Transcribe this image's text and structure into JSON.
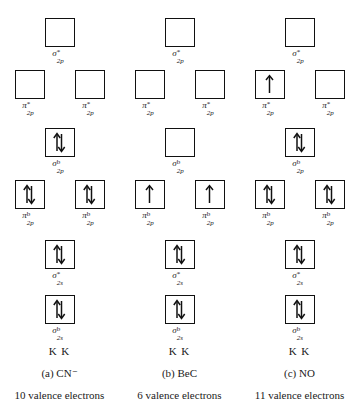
{
  "figure": {
    "type": "molecular-orbital-energy-level-diagram",
    "columns": [
      {
        "caption": "(a)  CN⁻",
        "species": "CN⁻",
        "kk": "K K",
        "valence": "10 valence electrons",
        "levels": [
          {
            "id": "sigma-star-2p",
            "kind": "single",
            "sym": "σ",
            "sup": "*",
            "sub": "2p",
            "boxes": [
              "empty"
            ]
          },
          {
            "id": "pi-star-2p",
            "kind": "pair",
            "sym": "π",
            "sup": "*",
            "sub": "2p",
            "boxes": [
              "empty",
              "empty"
            ]
          },
          {
            "id": "sigma-b-2p",
            "kind": "single",
            "sym": "σ",
            "sup": "b",
            "sub": "2p",
            "boxes": [
              "paired"
            ]
          },
          {
            "id": "pi-b-2p",
            "kind": "pair",
            "sym": "π",
            "sup": "b",
            "sub": "2p",
            "boxes": [
              "paired",
              "paired"
            ]
          },
          {
            "id": "sigma-star-2s",
            "kind": "single",
            "sym": "σ",
            "sup": "*",
            "sub": "2s",
            "boxes": [
              "paired"
            ]
          },
          {
            "id": "sigma-b-2s",
            "kind": "single",
            "sym": "σ",
            "sup": "b",
            "sub": "2s",
            "boxes": [
              "paired"
            ]
          }
        ]
      },
      {
        "caption": "(b)  BeC",
        "species": "BeC",
        "kk": "K K",
        "valence": "6 valence electrons",
        "levels": [
          {
            "id": "sigma-star-2p",
            "kind": "single",
            "sym": "σ",
            "sup": "*",
            "sub": "2p",
            "boxes": [
              "empty"
            ]
          },
          {
            "id": "pi-star-2p",
            "kind": "pair",
            "sym": "π",
            "sup": "*",
            "sub": "2p",
            "boxes": [
              "empty",
              "empty"
            ]
          },
          {
            "id": "sigma-b-2p",
            "kind": "single",
            "sym": "σ",
            "sup": "b",
            "sub": "2p",
            "boxes": [
              "empty"
            ]
          },
          {
            "id": "pi-b-2p",
            "kind": "pair",
            "sym": "π",
            "sup": "b",
            "sub": "2p",
            "boxes": [
              "single",
              "single"
            ]
          },
          {
            "id": "sigma-star-2s",
            "kind": "single",
            "sym": "σ",
            "sup": "*",
            "sub": "2s",
            "boxes": [
              "paired"
            ]
          },
          {
            "id": "sigma-b-2s",
            "kind": "single",
            "sym": "σ",
            "sup": "b",
            "sub": "2s",
            "boxes": [
              "paired"
            ]
          }
        ]
      },
      {
        "caption": "(c)  NO",
        "species": "NO",
        "kk": "K K",
        "valence": "11 valence electrons",
        "levels": [
          {
            "id": "sigma-star-2p",
            "kind": "single",
            "sym": "σ",
            "sup": "*",
            "sub": "2p",
            "boxes": [
              "empty"
            ]
          },
          {
            "id": "pi-star-2p",
            "kind": "pair",
            "sym": "π",
            "sup": "*",
            "sub": "2p",
            "boxes": [
              "single",
              "empty"
            ]
          },
          {
            "id": "sigma-b-2p",
            "kind": "single",
            "sym": "σ",
            "sup": "b",
            "sub": "2p",
            "boxes": [
              "paired"
            ]
          },
          {
            "id": "pi-b-2p",
            "kind": "pair",
            "sym": "π",
            "sup": "b",
            "sub": "2p",
            "boxes": [
              "paired",
              "paired"
            ]
          },
          {
            "id": "sigma-star-2s",
            "kind": "single",
            "sym": "σ",
            "sup": "*",
            "sub": "2s",
            "boxes": [
              "paired"
            ]
          },
          {
            "id": "sigma-b-2s",
            "kind": "single",
            "sym": "σ",
            "sup": "b",
            "sub": "2s",
            "boxes": [
              "paired"
            ]
          }
        ]
      }
    ],
    "row_tops": [
      18,
      70,
      128,
      180,
      240,
      295
    ],
    "colors": {
      "background": "#ffffff",
      "ink": "#111111",
      "text": "#1a1a1a"
    }
  }
}
